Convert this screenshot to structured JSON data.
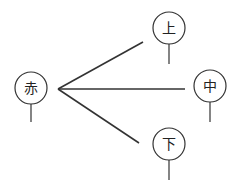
{
  "diagram": {
    "type": "tree",
    "stroke_color": "#333333",
    "root": {
      "id": "root",
      "label": "赤",
      "cx": 31,
      "cy": 88,
      "r": 16,
      "stem_end": 122
    },
    "vertex": {
      "x": 58,
      "y": 89
    },
    "children": [
      {
        "id": "top",
        "label": "上",
        "cx": 169,
        "cy": 28,
        "r": 16,
        "stem_end": 64,
        "edge_end": {
          "x": 143,
          "y": 42
        }
      },
      {
        "id": "middle",
        "label": "中",
        "cx": 210,
        "cy": 86,
        "r": 16,
        "stem_end": 122,
        "edge_end": {
          "x": 185,
          "y": 89
        }
      },
      {
        "id": "bottom",
        "label": "下",
        "cx": 169,
        "cy": 144,
        "r": 16,
        "stem_end": 180,
        "edge_end": {
          "x": 139,
          "y": 143
        }
      }
    ]
  }
}
